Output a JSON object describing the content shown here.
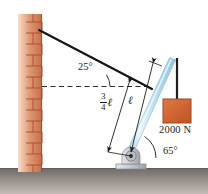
{
  "figure": {
    "name": "boom-and-cable-statics-diagram",
    "type": "engineering-mechanics-free-body-figure"
  },
  "labels": {
    "cable_angle": "25°",
    "boom_base_angle": "65°",
    "load_weight": "2000 N",
    "boom_full_length": "ℓ",
    "cable_attach_length_numerator": "3",
    "cable_attach_length_denominator": "4",
    "cable_attach_length_unit": "ℓ"
  },
  "colors": {
    "brick_face": "#c9784f",
    "brick_light": "#f3cdb7",
    "brick_mortar_line": "#b4462a",
    "ground_dark": "#6b6b6b",
    "ground_light": "#b9b0ad",
    "boom_blue": "#a8d4e8",
    "boom_highlight": "#eaf6fb",
    "load_block": "#d1622e",
    "load_block_edge": "#a44620",
    "support_gray": "#c9cdd1",
    "support_edge": "#8a8f94",
    "line_black": "#1a1a1a"
  },
  "elements": {
    "wall": "brick-wall",
    "ground": "ground-strip",
    "cable": "support-cable",
    "boom": "boom-member",
    "rope": "hanging-rope",
    "load": "suspended-load-block",
    "pin_support": "pin-support",
    "datum": "horizontal-dashed-datum",
    "dim_full": "dimension-line-full-length",
    "dim_frac": "dimension-line-three-quarter-length",
    "arc_top": "angle-arc-25",
    "arc_base": "angle-arc-65"
  }
}
